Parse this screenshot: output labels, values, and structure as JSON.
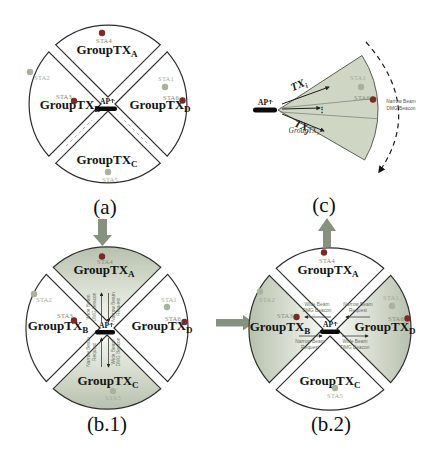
{
  "colors": {
    "shade_dark": "#b7c1ad",
    "shade_light": "#f5f7f1",
    "fan_fill": "#cfd6c4",
    "connector": "#87917f",
    "sta_active": "#7b2a26",
    "sta_idle": "#a9b19f",
    "label_active": "#828a76",
    "label_idle": "#a3ab9a",
    "outline": "#2e2e2e",
    "message": "#676f62"
  },
  "captions": {
    "a": "(a)",
    "b1": "(b.1)",
    "b2": "(b.2)",
    "c": "(c)"
  },
  "labels": {
    "group": "GroupTX",
    "ap": "AP",
    "tx": "TX",
    "vdots": "⋮",
    "sub_a": "A",
    "sub_b": "B",
    "sub_c": "C",
    "sub_d": "D",
    "sub_i": "i",
    "sub_j": "j",
    "sub_n": "n"
  },
  "stations": {
    "sta1": "STA1",
    "sta2": "STA2",
    "sta3": "STA3",
    "sta4": "STA4",
    "sta5": "STA5",
    "sta6": "STA6"
  },
  "messages": {
    "wide_beam": "Wide Beam",
    "dmg_beacon": "DMG Beacon",
    "narrow_beam": "Narrow Beam",
    "request": "Request"
  }
}
